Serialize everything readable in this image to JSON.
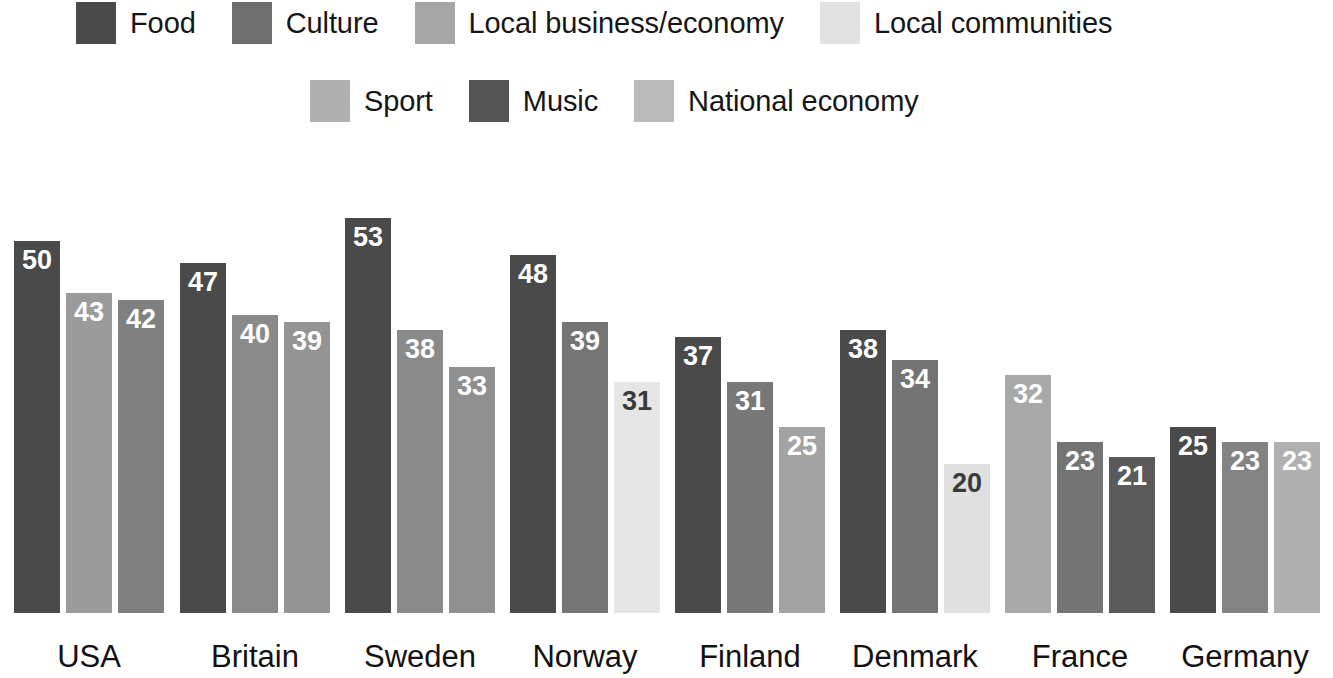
{
  "legend": {
    "rows": [
      [
        {
          "label": "Food",
          "color": "#4a4a4a",
          "key": "food"
        },
        {
          "label": "Culture",
          "color": "#6e6e6e",
          "key": "culture"
        },
        {
          "label": "Local business/economy",
          "color": "#a6a6a6",
          "key": "local-business-economy"
        },
        {
          "label": "Local communities",
          "color": "#e2e2e2",
          "key": "local-communities"
        }
      ],
      [
        {
          "label": "Sport",
          "color": "#b0b0b0",
          "key": "sport"
        },
        {
          "label": "Music",
          "color": "#555555",
          "key": "music"
        },
        {
          "label": "National economy",
          "color": "#b9b9b9",
          "key": "national-economy"
        }
      ]
    ]
  },
  "footnote": "",
  "chart_data": {
    "type": "bar",
    "title": "",
    "xlabel": "",
    "ylabel": "",
    "ylim": [
      0,
      55
    ],
    "grid": false,
    "legend_position": "top",
    "categories": [
      "USA",
      "Britain",
      "Sweden",
      "Norway",
      "Finland",
      "Denmark",
      "France",
      "Germany"
    ],
    "series_names": [
      "Food",
      "Culture",
      "Local business/economy",
      "Local communities",
      "Sport",
      "Music",
      "National economy"
    ],
    "groups": [
      {
        "category": "USA",
        "bars": [
          {
            "value": 50,
            "series": "Food",
            "color": "#4a4a4a",
            "label_color": "light"
          },
          {
            "value": 43,
            "series": "Sport",
            "color": "#9b9b9b",
            "label_color": "light"
          },
          {
            "value": 42,
            "series": "Culture",
            "color": "#808080",
            "label_color": "light"
          }
        ]
      },
      {
        "category": "Britain",
        "bars": [
          {
            "value": 47,
            "series": "Food",
            "color": "#4a4a4a",
            "label_color": "light"
          },
          {
            "value": 40,
            "series": "Culture",
            "color": "#8a8a8a",
            "label_color": "light"
          },
          {
            "value": 39,
            "series": "Sport",
            "color": "#949494",
            "label_color": "light"
          }
        ]
      },
      {
        "category": "Sweden",
        "bars": [
          {
            "value": 53,
            "series": "Food",
            "color": "#4a4a4a",
            "label_color": "light"
          },
          {
            "value": 38,
            "series": "Culture",
            "color": "#8a8a8a",
            "label_color": "light"
          },
          {
            "value": 33,
            "series": "Sport",
            "color": "#8f8f8f",
            "label_color": "light"
          }
        ]
      },
      {
        "category": "Norway",
        "bars": [
          {
            "value": 48,
            "series": "Food",
            "color": "#4a4a4a",
            "label_color": "light"
          },
          {
            "value": 39,
            "series": "Culture",
            "color": "#757575",
            "label_color": "light"
          },
          {
            "value": 31,
            "series": "Local communities",
            "color": "#e6e6e6",
            "label_color": "dark"
          }
        ]
      },
      {
        "category": "Finland",
        "bars": [
          {
            "value": 37,
            "series": "Food",
            "color": "#4a4a4a",
            "label_color": "light"
          },
          {
            "value": 31,
            "series": "Culture",
            "color": "#787878",
            "label_color": "light"
          },
          {
            "value": 25,
            "series": "Sport",
            "color": "#a3a3a3",
            "label_color": "light"
          }
        ]
      },
      {
        "category": "Denmark",
        "bars": [
          {
            "value": 38,
            "series": "Food",
            "color": "#4a4a4a",
            "label_color": "light"
          },
          {
            "value": 34,
            "series": "Culture",
            "color": "#747474",
            "label_color": "light"
          },
          {
            "value": 20,
            "series": "Local communities",
            "color": "#e0e0e0",
            "label_color": "dark"
          }
        ]
      },
      {
        "category": "France",
        "bars": [
          {
            "value": 32,
            "series": "Sport",
            "color": "#a8a8a8",
            "label_color": "light"
          },
          {
            "value": 23,
            "series": "Culture",
            "color": "#747474",
            "label_color": "light"
          },
          {
            "value": 21,
            "series": "Music",
            "color": "#5a5a5a",
            "label_color": "light"
          }
        ]
      },
      {
        "category": "Germany",
        "bars": [
          {
            "value": 25,
            "series": "Food",
            "color": "#4a4a4a",
            "label_color": "light"
          },
          {
            "value": 23,
            "series": "Culture",
            "color": "#838383",
            "label_color": "light"
          },
          {
            "value": 23,
            "series": "National economy",
            "color": "#b0b0b0",
            "label_color": "light"
          }
        ]
      }
    ]
  },
  "layout": {
    "group_left_px": [
      14,
      180,
      345,
      510,
      675,
      840,
      1005,
      1170
    ],
    "bar_width_px": 46,
    "bar_gap_px": 6,
    "px_per_unit": 7.45,
    "baseline_y_px": 613
  }
}
